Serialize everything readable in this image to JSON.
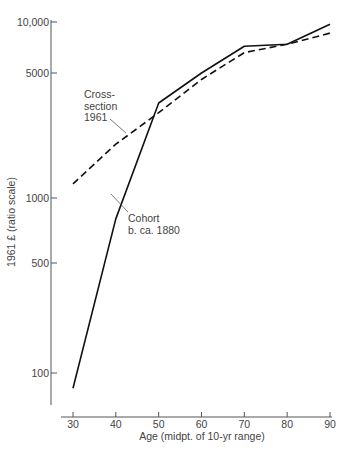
{
  "chart_data": {
    "type": "line",
    "title": "",
    "xlabel": "Age (midpt. of 10-yr range)",
    "ylabel": "1961 £ (ratio scale)",
    "yscale": "log",
    "x": [
      30,
      40,
      50,
      60,
      70,
      80,
      90
    ],
    "x_ticks": [
      "30",
      "40",
      "50",
      "60",
      "70",
      "80",
      "90"
    ],
    "y_ticks": [
      {
        "value": 10000,
        "label": "10,000"
      },
      {
        "value": 5000,
        "label": "5000"
      },
      {
        "value": 1000,
        "label": "1000"
      },
      {
        "value": 500,
        "label": "500"
      },
      {
        "value": 100,
        "label": "100"
      }
    ],
    "ylim": [
      60,
      10500
    ],
    "grid": false,
    "legend": "inline annotations",
    "series": [
      {
        "name": "Cohort b. ca. 1880",
        "style": "solid",
        "values": [
          80,
          800,
          3400,
          5000,
          7200,
          7400,
          9700
        ]
      },
      {
        "name": "Cross-section 1961",
        "style": "dashed",
        "values": [
          1200,
          2000,
          3000,
          4600,
          6600,
          7400,
          8600
        ]
      }
    ],
    "annotations": [
      {
        "text": [
          "Cross-",
          "section",
          "1961"
        ],
        "points_to": "Cross-section 1961"
      },
      {
        "text": [
          "Cohort",
          "b. ca. 1880"
        ],
        "points_to": "Cohort b. ca. 1880"
      }
    ]
  },
  "colors": {
    "line": "#111111",
    "axis": "#555555",
    "text": "#444444"
  }
}
